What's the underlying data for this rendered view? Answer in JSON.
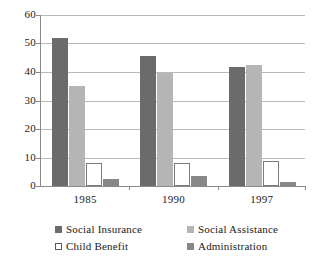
{
  "chart_data": {
    "type": "bar",
    "title": "",
    "subtitle": "",
    "xlabel": "",
    "ylabel": "",
    "categories": [
      "1985",
      "1990",
      "1997"
    ],
    "series": [
      {
        "name": "Social Insurance",
        "color": "#6b6b6b",
        "values": [
          52.0,
          45.5,
          41.7
        ]
      },
      {
        "name": "Social Assistance",
        "color": "#b5b5b5",
        "values": [
          35.0,
          39.7,
          42.5
        ]
      },
      {
        "name": "Child Benefit",
        "color": "#ffffff",
        "values": [
          8.0,
          8.0,
          8.7
        ]
      },
      {
        "name": "Administration",
        "color": "#878787",
        "values": [
          2.5,
          3.5,
          1.5
        ]
      }
    ],
    "ylim": [
      0,
      60
    ],
    "yticks": [
      "0",
      "10",
      "20",
      "30",
      "40",
      "50",
      "60"
    ],
    "ytick_values": [
      0,
      10,
      20,
      30,
      40,
      50,
      60
    ],
    "grid": true,
    "grid_axis": "y",
    "legend_position": "bottom",
    "legend_columns": 2
  },
  "axes": {
    "y_tick_labels": [
      "60",
      "50",
      "40",
      "30",
      "20",
      "10",
      "0"
    ],
    "x_tick_labels": [
      "1985",
      "1990",
      "1997"
    ]
  },
  "legend": {
    "entries": [
      {
        "label": "Social Insurance",
        "swatch": "#6b6b6b"
      },
      {
        "label": "Social Assistance",
        "swatch": "#b5b5b5"
      },
      {
        "label": "Child Benefit",
        "swatch": "#ffffff"
      },
      {
        "label": "Administration",
        "swatch": "#878787"
      }
    ]
  },
  "colors": {
    "background": "#ffffff",
    "gridline": "#b9b9b9",
    "axis": "#8a8a8a",
    "text": "#1a1a1a"
  }
}
